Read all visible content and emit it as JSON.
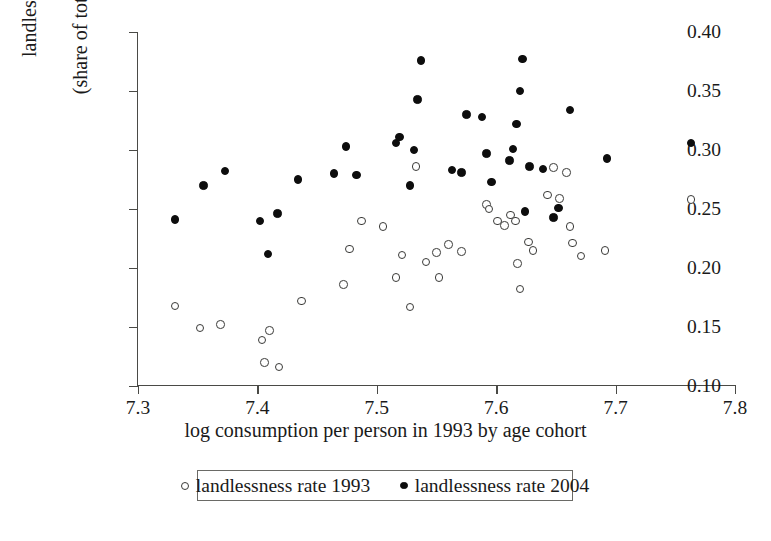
{
  "chart_data": {
    "type": "scatter",
    "title": "",
    "xlabel": "log consumption per person in 1993 by age cohort",
    "ylabel_line1": "landlessness rate",
    "ylabel_line2": "(share of total population)",
    "xlim": [
      7.3,
      7.8
    ],
    "ylim": [
      0.1,
      0.4
    ],
    "xticks": [
      "7.3",
      "7.4",
      "7.5",
      "7.6",
      "7.7",
      "7.8"
    ],
    "xtick_values": [
      7.3,
      7.4,
      7.5,
      7.6,
      7.7,
      7.8
    ],
    "yticks": [
      "0.10",
      "0.15",
      "0.20",
      "0.25",
      "0.30",
      "0.35",
      "0.40"
    ],
    "ytick_values": [
      0.1,
      0.15,
      0.2,
      0.25,
      0.3,
      0.35,
      0.4
    ],
    "grid": false,
    "legend_position": "below-axis",
    "marker_colors": {
      "series_1993": "#ffffff",
      "series_1993_edge": "#3a3a38",
      "series_2004": "#0d0d0d"
    },
    "series": [
      {
        "name": "landlessness rate 1993",
        "marker": "open-circle",
        "points": [
          [
            7.331,
            0.168
          ],
          [
            7.352,
            0.149
          ],
          [
            7.369,
            0.152
          ],
          [
            7.404,
            0.139
          ],
          [
            7.406,
            0.12
          ],
          [
            7.41,
            0.147
          ],
          [
            7.418,
            0.116
          ],
          [
            7.437,
            0.172
          ],
          [
            7.472,
            0.186
          ],
          [
            7.477,
            0.216
          ],
          [
            7.487,
            0.24
          ],
          [
            7.505,
            0.235
          ],
          [
            7.516,
            0.192
          ],
          [
            7.521,
            0.211
          ],
          [
            7.528,
            0.167
          ],
          [
            7.533,
            0.286
          ],
          [
            7.541,
            0.205
          ],
          [
            7.55,
            0.213
          ],
          [
            7.552,
            0.192
          ],
          [
            7.56,
            0.22
          ],
          [
            7.571,
            0.214
          ],
          [
            7.592,
            0.254
          ],
          [
            7.594,
            0.25
          ],
          [
            7.601,
            0.24
          ],
          [
            7.607,
            0.236
          ],
          [
            7.612,
            0.245
          ],
          [
            7.616,
            0.24
          ],
          [
            7.618,
            0.204
          ],
          [
            7.62,
            0.182
          ],
          [
            7.627,
            0.222
          ],
          [
            7.631,
            0.215
          ],
          [
            7.643,
            0.262
          ],
          [
            7.648,
            0.285
          ],
          [
            7.653,
            0.259
          ],
          [
            7.659,
            0.281
          ],
          [
            7.662,
            0.235
          ],
          [
            7.664,
            0.221
          ],
          [
            7.671,
            0.21
          ],
          [
            7.691,
            0.215
          ],
          [
            7.763,
            0.258
          ]
        ]
      },
      {
        "name": "landlessness rate 2004",
        "marker": "filled-circle",
        "points": [
          [
            7.331,
            0.241
          ],
          [
            7.355,
            0.27
          ],
          [
            7.373,
            0.282
          ],
          [
            7.402,
            0.24
          ],
          [
            7.409,
            0.212
          ],
          [
            7.417,
            0.246
          ],
          [
            7.434,
            0.275
          ],
          [
            7.464,
            0.28
          ],
          [
            7.474,
            0.303
          ],
          [
            7.483,
            0.279
          ],
          [
            7.516,
            0.306
          ],
          [
            7.519,
            0.311
          ],
          [
            7.528,
            0.27
          ],
          [
            7.531,
            0.3
          ],
          [
            7.534,
            0.343
          ],
          [
            7.537,
            0.376
          ],
          [
            7.563,
            0.283
          ],
          [
            7.571,
            0.281
          ],
          [
            7.575,
            0.33
          ],
          [
            7.588,
            0.328
          ],
          [
            7.592,
            0.297
          ],
          [
            7.596,
            0.273
          ],
          [
            7.611,
            0.291
          ],
          [
            7.614,
            0.301
          ],
          [
            7.617,
            0.322
          ],
          [
            7.62,
            0.35
          ],
          [
            7.622,
            0.377
          ],
          [
            7.624,
            0.248
          ],
          [
            7.628,
            0.286
          ],
          [
            7.639,
            0.284
          ],
          [
            7.648,
            0.243
          ],
          [
            7.652,
            0.251
          ],
          [
            7.662,
            0.334
          ],
          [
            7.693,
            0.293
          ],
          [
            7.763,
            0.306
          ]
        ]
      }
    ]
  },
  "legend": {
    "entries": [
      {
        "label": "landlessness rate 1993",
        "marker": "open-circle"
      },
      {
        "label": "landlessness rate 2004",
        "marker": "filled-circle"
      }
    ]
  }
}
